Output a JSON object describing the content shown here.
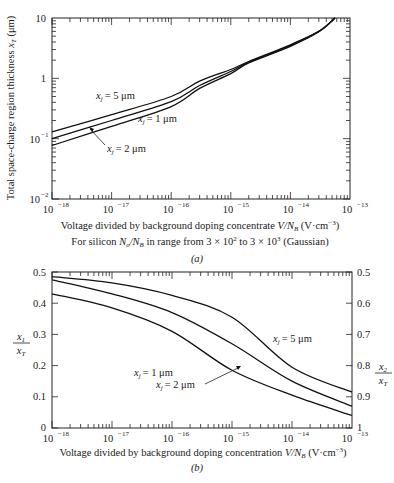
{
  "chart_data": [
    {
      "panel": "a",
      "type": "line",
      "title": "",
      "caption": "(a)",
      "xlabel": "Voltage divided by background doping concentrate V/N_B (V·cm^-3)",
      "subtitle": "For silicon N_o/N_B in range from 3 × 10^2 to 3 × 10^3 (Gaussian)",
      "ylabel": "Total space-charge region thickness x_T (μm)",
      "xscale": "log",
      "yscale": "log",
      "xlim": [
        1e-18,
        1e-13
      ],
      "ylim": [
        0.01,
        10
      ],
      "xticks": [
        "10^-18",
        "10^-17",
        "10^-16",
        "10^-15",
        "10^-14",
        "10^-13"
      ],
      "yticks": [
        "10^-2",
        "10^-1",
        "1",
        "10"
      ],
      "grid": false,
      "series": [
        {
          "name": "x_j = 5 μm",
          "x": [
            1e-18,
            1e-17,
            1e-16,
            3e-16,
            1e-15,
            2e-15,
            1e-14,
            3e-14,
            5.6e-14
          ],
          "y": [
            0.13,
            0.25,
            0.5,
            0.9,
            1.4,
            1.9,
            3.6,
            6.0,
            10
          ]
        },
        {
          "name": "x_j = 1 μm",
          "x": [
            1e-18,
            1e-17,
            1e-16,
            3e-16,
            1e-15,
            2e-15,
            1e-14,
            3e-14,
            5.6e-14
          ],
          "y": [
            0.1,
            0.2,
            0.41,
            0.76,
            1.3,
            1.85,
            3.5,
            6.0,
            10
          ]
        },
        {
          "name": "x_j = 2 μm",
          "x": [
            1e-18,
            1e-17,
            1e-16,
            3e-16,
            1e-15,
            2e-15,
            1e-14,
            3e-14,
            5.6e-14
          ],
          "y": [
            0.077,
            0.16,
            0.34,
            0.68,
            1.2,
            1.8,
            3.4,
            5.9,
            10
          ]
        }
      ],
      "annotations": [
        {
          "text": "x_j = 5 μm"
        },
        {
          "text": "x_j = 1 μm"
        },
        {
          "text": "x_j = 2 μm",
          "arrow": true
        }
      ]
    },
    {
      "panel": "b",
      "type": "line",
      "title": "",
      "caption": "(b)",
      "xlabel": "Voltage divided by background doping concentration V/N_B (V·cm^-3)",
      "ylabel": "x_1 / x_T",
      "ylabel_right": "x_2 / x_T",
      "xscale": "log",
      "yscale": "linear",
      "xlim": [
        1e-18,
        1e-13
      ],
      "ylim": [
        0,
        0.5
      ],
      "ylim_right": [
        1,
        0.5
      ],
      "xticks": [
        "10^-18",
        "10^-17",
        "10^-16",
        "10^-15",
        "10^-14",
        "10^-13"
      ],
      "yticks": [
        "0",
        "0.1",
        "0.2",
        "0.3",
        "0.4",
        "0.5"
      ],
      "yticks_right": [
        "1",
        "0.9",
        "0.8",
        "0.7",
        "0.6",
        "0.5"
      ],
      "grid": false,
      "series": [
        {
          "name": "x_j = 5 μm",
          "x": [
            1e-18,
            1e-17,
            1e-16,
            1e-15,
            1e-14,
            1e-13
          ],
          "y": [
            0.485,
            0.465,
            0.425,
            0.355,
            0.195,
            0.115
          ]
        },
        {
          "name": "x_j = 2 μm",
          "x": [
            1e-18,
            1e-17,
            1e-16,
            1e-15,
            1e-14,
            1e-13
          ],
          "y": [
            0.475,
            0.43,
            0.37,
            0.27,
            0.15,
            0.07
          ]
        },
        {
          "name": "x_j = 1 μm",
          "x": [
            1e-18,
            1e-17,
            1e-16,
            1e-15,
            1e-14,
            1e-13
          ],
          "y": [
            0.43,
            0.385,
            0.31,
            0.185,
            0.105,
            0.04
          ]
        }
      ],
      "annotations": [
        {
          "text": "x_j = 5 μm"
        },
        {
          "text": "x_j = 1 μm"
        },
        {
          "text": "x_j = 2 μm",
          "arrow": true
        }
      ]
    }
  ],
  "panel_a": {
    "ylabel": "Total space-charge region thickness",
    "ylabel_sym": "x",
    "ylabel_sub": "T",
    "ylabel_unit": "(μm)",
    "yticks": [
      {
        "base": "10",
        "exp": ""
      },
      {
        "base": "1",
        "exp": ""
      },
      {
        "base": "10",
        "exp": "−1"
      },
      {
        "base": "10",
        "exp": "−2"
      }
    ],
    "xticks": [
      "−18",
      "−17",
      "−16",
      "−15",
      "−14",
      "−13"
    ],
    "xtick_base": "10",
    "xlabel_text": "Voltage divided by background doping concentrate",
    "xlabel_var": "V/N",
    "xlabel_sub": "B",
    "xlabel_unit": "(V·cm",
    "xlabel_exp": "−3",
    "xlabel_close": ")",
    "subtitle_pre": "For silicon",
    "subtitle_var": "N",
    "subtitle_sub1": "o",
    "subtitle_var2": "/N",
    "subtitle_sub2": "B",
    "subtitle_mid": "in range from 3 × 10",
    "subtitle_e1": "2",
    "subtitle_mid2": "to 3 × 10",
    "subtitle_e2": "3",
    "subtitle_post": "(Gaussian)",
    "caption": "(a)",
    "label_5": "= 5 μm",
    "label_1": "= 1 μm",
    "label_2": "= 2 μm",
    "label_sym": "x",
    "label_sub": "j"
  },
  "panel_b": {
    "yticks_left": [
      "0.5",
      "0.4",
      "0.3",
      "0.2",
      "0.1",
      "0"
    ],
    "yticks_right": [
      "0.5",
      "0.6",
      "0.7",
      "0.8",
      "0.9",
      "1"
    ],
    "ylabel_left_num": "x",
    "ylabel_left_num_sub": "1",
    "ylabel_left_den": "x",
    "ylabel_left_den_sub": "T",
    "ylabel_right_num": "x",
    "ylabel_right_num_sub": "2",
    "ylabel_right_den": "x",
    "ylabel_right_den_sub": "T",
    "xticks": [
      "−18",
      "−17",
      "−16",
      "−15",
      "−14",
      "−13"
    ],
    "xtick_base": "10",
    "xlabel_text": "Voltage divided by background doping concentration",
    "xlabel_var": "V/N",
    "xlabel_sub": "B",
    "xlabel_unit": "(V·cm",
    "xlabel_exp": "−3",
    "xlabel_close": ")",
    "caption": "(b)",
    "label_5": "= 5 μm",
    "label_1": "= 1 μm",
    "label_2": "= 2 μm",
    "label_sym": "x",
    "label_sub": "j"
  }
}
